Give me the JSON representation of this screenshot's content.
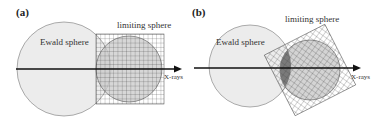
{
  "panels": [
    {
      "label": "(a)",
      "ewald_label": "Ewald sphere",
      "limiting_label": "limiting sphere",
      "axis_label": "X-rays"
    },
    {
      "label": "(b)",
      "ewald_label": "Ewald sphere",
      "limiting_label": "limiting sphere",
      "axis_label": "X-rays"
    }
  ],
  "colors": {
    "ewald_fill": "#ececec",
    "limiting_fill": "#c8c8c8",
    "intersect_fill": "#7a7a7a",
    "grid": "#333333",
    "axis": "#111111"
  }
}
